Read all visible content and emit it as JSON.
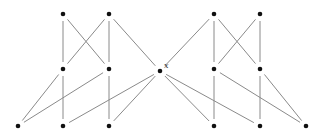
{
  "diagram": {
    "type": "hasse-diagram",
    "colors": {
      "node": "#111111",
      "edge": "#8a8a8a",
      "label": "#333333"
    },
    "node_radius": 2.3,
    "edge_gap": 7,
    "nodes": [
      {
        "id": "a1",
        "x": 63,
        "y": 14
      },
      {
        "id": "a2",
        "x": 109,
        "y": 14
      },
      {
        "id": "b1",
        "x": 63,
        "y": 69
      },
      {
        "id": "b2",
        "x": 109,
        "y": 69
      },
      {
        "id": "c1",
        "x": 18,
        "y": 126
      },
      {
        "id": "c2",
        "x": 63,
        "y": 126
      },
      {
        "id": "c3",
        "x": 109,
        "y": 126
      },
      {
        "id": "x",
        "x": 160,
        "y": 71,
        "label": "x"
      },
      {
        "id": "d1",
        "x": 214,
        "y": 14
      },
      {
        "id": "d2",
        "x": 260,
        "y": 14
      },
      {
        "id": "e1",
        "x": 214,
        "y": 69
      },
      {
        "id": "e2",
        "x": 260,
        "y": 69
      },
      {
        "id": "f1",
        "x": 214,
        "y": 126
      },
      {
        "id": "f2",
        "x": 260,
        "y": 126
      },
      {
        "id": "f3",
        "x": 306,
        "y": 126
      }
    ],
    "edges": [
      [
        "a1",
        "b1"
      ],
      [
        "a2",
        "b2"
      ],
      [
        "a1",
        "b2"
      ],
      [
        "a2",
        "b1"
      ],
      [
        "a2",
        "x"
      ],
      [
        "b1",
        "c2"
      ],
      [
        "b1",
        "c1"
      ],
      [
        "b2",
        "c1"
      ],
      [
        "b2",
        "c3"
      ],
      [
        "x",
        "c2"
      ],
      [
        "x",
        "c3"
      ],
      [
        "d1",
        "x"
      ],
      [
        "d1",
        "e1"
      ],
      [
        "d2",
        "e2"
      ],
      [
        "d1",
        "e2"
      ],
      [
        "d2",
        "e1"
      ],
      [
        "x",
        "f1"
      ],
      [
        "x",
        "f2"
      ],
      [
        "e1",
        "f1"
      ],
      [
        "e1",
        "f3"
      ],
      [
        "e2",
        "f2"
      ],
      [
        "e2",
        "f3"
      ]
    ]
  }
}
